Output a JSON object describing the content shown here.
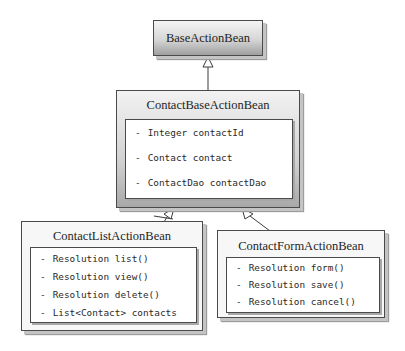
{
  "diagram": {
    "type": "uml-class-diagram",
    "classes": [
      {
        "name": "BaseActionBean",
        "members": []
      },
      {
        "name": "ContactBaseActionBean",
        "members": [
          {
            "visibility": "-",
            "text": "Integer contactId"
          },
          {
            "visibility": "-",
            "text": "Contact contact"
          },
          {
            "visibility": "-",
            "text": "ContactDao contactDao"
          }
        ]
      },
      {
        "name": "ContactListActionBean",
        "members": [
          {
            "visibility": "-",
            "text": "Resolution list()"
          },
          {
            "visibility": "-",
            "text": "Resolution view()"
          },
          {
            "visibility": "-",
            "text": "Resolution delete()"
          },
          {
            "visibility": "-",
            "text": "List<Contact> contacts"
          }
        ]
      },
      {
        "name": "ContactFormActionBean",
        "members": [
          {
            "visibility": "-",
            "text": "Resolution form()"
          },
          {
            "visibility": "-",
            "text": "Resolution save()"
          },
          {
            "visibility": "-",
            "text": "Resolution cancel()"
          }
        ]
      }
    ],
    "relationships": [
      {
        "from": "ContactBaseActionBean",
        "to": "BaseActionBean",
        "type": "inheritance"
      },
      {
        "from": "ContactListActionBean",
        "to": "ContactBaseActionBean",
        "type": "inheritance"
      },
      {
        "from": "ContactFormActionBean",
        "to": "ContactBaseActionBean",
        "type": "inheritance"
      }
    ],
    "colors": {
      "border": "#4a4a4a",
      "base_gradient_light": "#f4f4f4",
      "base_gradient_dark": "#9a9a9a",
      "mid_gradient_light": "#f2f2f2",
      "mid_gradient_dark": "#a6a6a6",
      "leaf_fill": "#f7f7f7",
      "inner_fill": "#ffffff"
    }
  }
}
